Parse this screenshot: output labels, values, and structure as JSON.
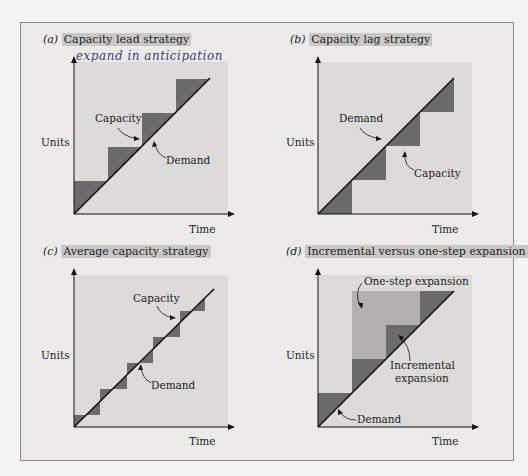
{
  "figure": {
    "panels": [
      {
        "id": "a",
        "letter": "(a)",
        "title": "Capacity lead strategy",
        "y_label": "Units",
        "x_label": "Time",
        "annotations": [
          "Capacity",
          "Demand"
        ],
        "handwritten_notes": [
          "expand in anticipation",
          "aggressive"
        ]
      },
      {
        "id": "b",
        "letter": "(b)",
        "title": "Capacity lag strategy",
        "y_label": "Units",
        "x_label": "Time",
        "annotations": [
          "Demand",
          "Capacity"
        ]
      },
      {
        "id": "c",
        "letter": "(c)",
        "title": "Average capacity strategy",
        "y_label": "Units",
        "x_label": "Time",
        "annotations": [
          "Capacity",
          "Demand"
        ]
      },
      {
        "id": "d",
        "letter": "(d)",
        "title": "Incremental versus one-step expansion",
        "y_label": "Units",
        "x_label": "Time",
        "annotations": [
          "One-step expansion",
          "Incremental",
          "expansion",
          "Demand"
        ]
      }
    ],
    "colors": {
      "plot_bg": "#dcdbd9",
      "frame_bg": "#ecebe9",
      "dark_fill": "#6b6b6b",
      "light_fill": "#b2b1af",
      "line": "#111111",
      "highlight": "#c9c8c6",
      "handwriting": "#3a3f7a"
    }
  }
}
